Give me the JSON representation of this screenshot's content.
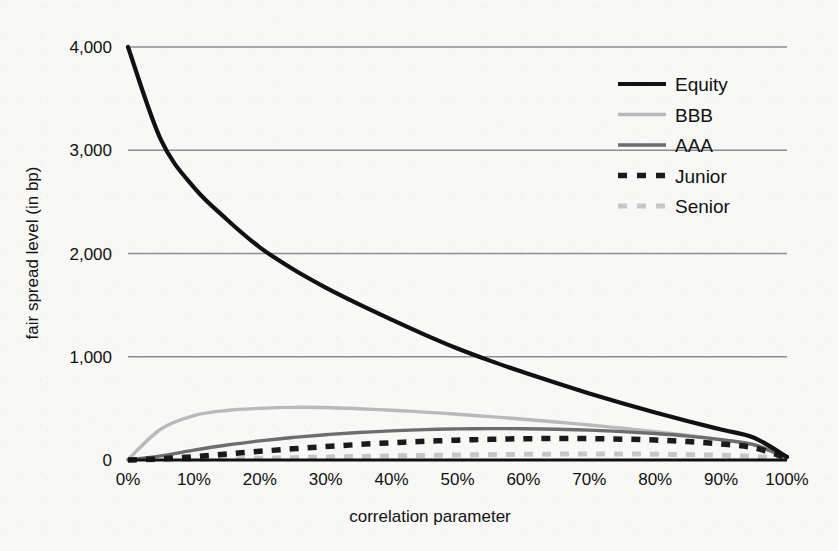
{
  "chart_data": {
    "type": "line",
    "title": "",
    "xlabel": "correlation parameter",
    "ylabel": "fair spread level (in bp)",
    "xlim": [
      0,
      100
    ],
    "ylim": [
      0,
      4000
    ],
    "grid": true,
    "legend_position": "top-right",
    "x_tick_labels": [
      "0%",
      "10%",
      "20%",
      "30%",
      "40%",
      "50%",
      "60%",
      "70%",
      "80%",
      "90%",
      "100%"
    ],
    "y_tick_labels": [
      "0",
      "1,000",
      "2,000",
      "3,000",
      "4,000"
    ],
    "x_ticks": [
      0,
      10,
      20,
      30,
      40,
      50,
      60,
      70,
      80,
      90,
      100
    ],
    "y_ticks": [
      0,
      1000,
      2000,
      3000,
      4000
    ],
    "x": [
      0,
      5,
      10,
      15,
      20,
      25,
      30,
      35,
      40,
      45,
      50,
      55,
      60,
      65,
      70,
      75,
      80,
      85,
      90,
      95,
      100
    ],
    "series": [
      {
        "name": "Equity",
        "color": "#111111",
        "width": 4.2,
        "dash": "none",
        "values": [
          4000,
          3100,
          2640,
          2330,
          2060,
          1850,
          1670,
          1510,
          1360,
          1215,
          1080,
          960,
          850,
          745,
          645,
          550,
          460,
          375,
          295,
          215,
          30
        ]
      },
      {
        "name": "BBB",
        "color": "#b9b9b9",
        "width": 3.4,
        "dash": "none",
        "values": [
          5,
          300,
          430,
          480,
          500,
          510,
          508,
          497,
          482,
          464,
          443,
          420,
          395,
          368,
          339,
          308,
          275,
          238,
          196,
          145,
          25
        ]
      },
      {
        "name": "AAA",
        "color": "#6d6d6d",
        "width": 3.4,
        "dash": "none",
        "values": [
          2,
          40,
          95,
          145,
          185,
          218,
          245,
          266,
          282,
          294,
          301,
          304,
          303,
          298,
          289,
          275,
          256,
          231,
          197,
          148,
          22
        ]
      },
      {
        "name": "Junior",
        "color": "#1a1a1a",
        "width": 5.5,
        "dash": "dashed",
        "values": [
          1,
          12,
          32,
          58,
          84,
          108,
          130,
          150,
          167,
          181,
          192,
          200,
          206,
          208,
          207,
          202,
          193,
          178,
          155,
          118,
          18
        ]
      },
      {
        "name": "Senior",
        "color": "#c6c6c6",
        "width": 5.0,
        "dash": "dashed",
        "values": [
          0,
          2,
          6,
          11,
          17,
          23,
          29,
          34,
          39,
          44,
          48,
          52,
          55,
          57,
          58,
          58,
          56,
          52,
          46,
          35,
          10
        ]
      }
    ]
  },
  "legend": {
    "items": [
      {
        "label": "Equity"
      },
      {
        "label": "BBB"
      },
      {
        "label": "AAA"
      },
      {
        "label": "Junior"
      },
      {
        "label": "Senior"
      }
    ]
  },
  "axes": {
    "x_title": "correlation parameter",
    "y_title": "fair spread level (in bp)"
  },
  "colors": {
    "background": "#f8f8f6",
    "gridline": "#8e8e8e",
    "axis": "#111111",
    "equity": "#111111",
    "bbb": "#b9b9b9",
    "aaa": "#6d6d6d",
    "junior": "#1a1a1a",
    "senior": "#c6c6c6"
  }
}
